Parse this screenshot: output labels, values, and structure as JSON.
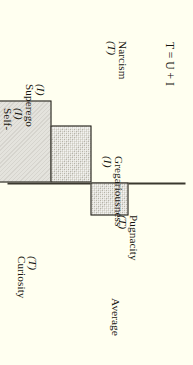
{
  "figure": {
    "background_color": "#fffff0",
    "bar_fill_color": "#cfcdc2",
    "bar_edge_color": "#1d1b14",
    "axis_color": "#3a382e",
    "axis_label": "Average",
    "formula": {
      "lhs": "T",
      "eq": " = ",
      "rhs": "U + I"
    },
    "formula_text": "T = U + I"
  },
  "chart_data": {
    "type": "bar",
    "title": "",
    "subtitle": "",
    "orientation": "horizontal-rotated",
    "xlabel": "",
    "ylabel": "",
    "baseline_label": "Average",
    "baseline_value": 0,
    "xlim": [
      -70,
      50
    ],
    "grid": false,
    "legend": "none",
    "annotations": [
      "T = U + I"
    ],
    "categories": [
      "Curiosity",
      "Pugnacity",
      "Gregariousness",
      "Self-sentiment",
      "Superego",
      "Narcism"
    ],
    "category_codes": [
      "(T)",
      "(T)",
      "(I)",
      "(I)",
      "(I)",
      "(T)"
    ],
    "tick_labels": [
      "Curiosity (T)",
      "Pugnacity (T)",
      "Gregariousness (I)",
      "Self-sentiment (I)",
      "Superego (I)",
      "Narcism (T)"
    ],
    "values": [
      -24,
      35,
      24,
      -55,
      -38,
      22
    ],
    "series": [
      {
        "name": "Deviation from average",
        "values": [
          -24,
          35,
          24,
          -55,
          -38,
          22
        ]
      }
    ]
  },
  "bars": [
    {
      "label": "Curiosity",
      "code": "(T)",
      "value": -24
    },
    {
      "label": "Pugnacity",
      "code": "(T)",
      "value": 35
    },
    {
      "label": "Gregariousness",
      "code": "(I)",
      "value": 24
    },
    {
      "label": "Self-sentiment",
      "code": "(I)",
      "value": -55
    },
    {
      "label": "Superego",
      "code": "(I)",
      "value": -38
    },
    {
      "label": "Narcism",
      "code": "(T)",
      "value": 22
    }
  ],
  "bar_labels": {
    "curiosity": {
      "name": "Curiosity",
      "code": "(T)"
    },
    "pugnacity": {
      "name": "Pugnacity",
      "code": "(T)"
    },
    "gregariousness": {
      "name": "Gregariousness",
      "code": "(I)"
    },
    "self_sentiment_line1": "Self-",
    "self_sentiment_line2": "sentiment",
    "self_sentiment_code": "(I)",
    "superego": {
      "name": "Superego",
      "code": "(I)"
    },
    "narcism": {
      "name": "Narcism",
      "code": "(T)"
    }
  }
}
